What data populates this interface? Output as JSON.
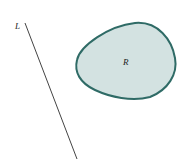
{
  "diagram": {
    "line": {
      "label": "L",
      "color": "#444444"
    },
    "region": {
      "label": "R",
      "fill": "#d3e2e1",
      "stroke": "#2f6b66"
    }
  }
}
